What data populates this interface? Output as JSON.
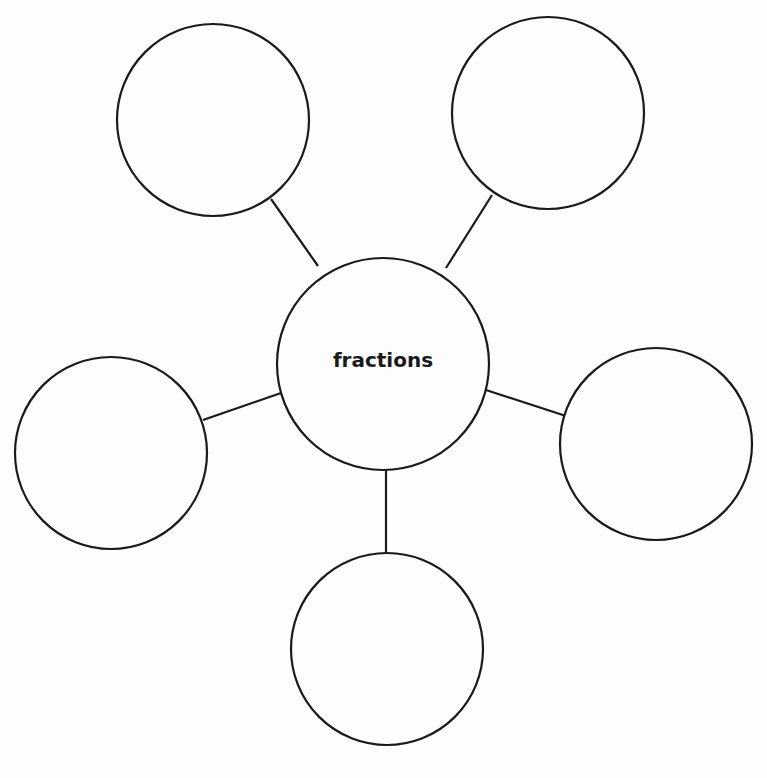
{
  "diagram": {
    "type": "concept-web",
    "stroke_color": "#1a1a1a",
    "background": "#fdfdfd",
    "center": {
      "label": "fractions",
      "cx": 383,
      "cy": 364,
      "r": 106
    },
    "nodes": [
      {
        "id": "top-left",
        "label": "",
        "cx": 213,
        "cy": 120,
        "r": 96,
        "line": [
          271,
          199,
          318,
          266
        ]
      },
      {
        "id": "top-right",
        "label": "",
        "cx": 548,
        "cy": 113,
        "r": 96,
        "line": [
          492,
          195,
          446,
          268
        ]
      },
      {
        "id": "left",
        "label": "",
        "cx": 111,
        "cy": 453,
        "r": 96,
        "line": [
          203,
          420,
          281,
          393
        ]
      },
      {
        "id": "right",
        "label": "",
        "cx": 656,
        "cy": 444,
        "r": 96,
        "line": [
          486,
          390,
          566,
          416
        ]
      },
      {
        "id": "bottom",
        "label": "",
        "cx": 387,
        "cy": 649,
        "r": 96,
        "line": [
          386,
          470,
          386,
          553
        ]
      }
    ]
  }
}
